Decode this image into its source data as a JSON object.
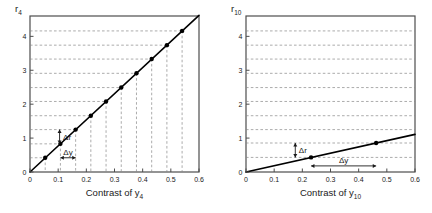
{
  "figure": {
    "background": "#ffffff",
    "panel_count": 2
  },
  "chart_data": [
    {
      "type": "line",
      "title": "",
      "panel_id": "left",
      "ylabel": "r_4",
      "ylabel_base": "r",
      "ylabel_sub": "4",
      "xlabel": "Contrast of y_4",
      "xlabel_base": "Contrast of y",
      "xlabel_sub": "4",
      "xlim": [
        0,
        0.6
      ],
      "ylim": [
        0,
        4.6
      ],
      "xticks": [
        0,
        0.1,
        0.2,
        0.3,
        0.4,
        0.5,
        0.6
      ],
      "xticklabels": [
        "0",
        "0.1",
        "0.2",
        "0.3",
        "0.4",
        "0.5",
        "0.6"
      ],
      "yticks": [
        0,
        1,
        2,
        3,
        4
      ],
      "yticklabels": [
        "0",
        "1",
        "2",
        "3",
        "4"
      ],
      "grid": "dashed-from-points",
      "line": {
        "slope": 7.7,
        "intercept": 0,
        "x_start": 0,
        "x_end": 0.6,
        "color": "#000000",
        "width": 1.6
      },
      "markers": {
        "shape": "dot",
        "color": "#000000",
        "size": 2.2
      },
      "x": [
        0.054,
        0.108,
        0.162,
        0.216,
        0.27,
        0.324,
        0.378,
        0.432,
        0.486,
        0.54
      ],
      "values": [
        0.42,
        0.83,
        1.25,
        1.66,
        2.08,
        2.49,
        2.91,
        3.33,
        3.74,
        4.16
      ],
      "gridlines_y": [
        0.42,
        0.83,
        1.25,
        1.66,
        2.08,
        2.49,
        2.91,
        3.33,
        3.74,
        4.16
      ],
      "gridlines_x": [
        0.054,
        0.108,
        0.162,
        0.216,
        0.27,
        0.324,
        0.378,
        0.432,
        0.486,
        0.54
      ],
      "annotations": [
        {
          "name": "delta-r",
          "label": "Δr",
          "type": "vertical-arrow",
          "x": 0.105,
          "y0": 0.83,
          "y1": 1.25
        },
        {
          "name": "delta-y",
          "label": "Δy",
          "type": "horizontal-arrow",
          "y": 0.42,
          "x0": 0.108,
          "x1": 0.162
        }
      ]
    },
    {
      "type": "line",
      "title": "",
      "panel_id": "right",
      "ylabel": "r_10",
      "ylabel_base": "r",
      "ylabel_sub": "10",
      "xlabel": "Contrast of y_10",
      "xlabel_base": "Contrast of y",
      "xlabel_sub": "10",
      "xlim": [
        0,
        0.6
      ],
      "ylim": [
        0,
        4.6
      ],
      "xticks": [
        0,
        0.1,
        0.2,
        0.3,
        0.4,
        0.5,
        0.6
      ],
      "xticklabels": [
        "0",
        "0.1",
        "0.2",
        "0.3",
        "0.4",
        "0.5",
        "0.6"
      ],
      "yticks": [
        0,
        1,
        2,
        3,
        4
      ],
      "yticklabels": [
        "0",
        "1",
        "2",
        "3",
        "4"
      ],
      "grid": "dashed-horizontal-full-width",
      "line": {
        "slope": 1.85,
        "intercept": 0,
        "x_start": 0,
        "x_end": 0.6,
        "color": "#000000",
        "width": 1.6
      },
      "markers": {
        "shape": "dot",
        "color": "#000000",
        "size": 2.2
      },
      "x": [
        0.231,
        0.462
      ],
      "values": [
        0.43,
        0.855
      ],
      "gridlines_y": [
        0.43,
        0.855,
        1.25,
        1.66,
        2.08,
        2.49,
        2.91,
        3.33,
        3.74,
        4.16
      ],
      "gridlines_x": [],
      "annotations": [
        {
          "name": "delta-r",
          "label": "Δr",
          "type": "vertical-arrow",
          "x": 0.175,
          "y0": 0.43,
          "y1": 0.855
        },
        {
          "name": "delta-y",
          "label": "Δy",
          "type": "horizontal-arrow",
          "y": 0.18,
          "x0": 0.231,
          "x1": 0.462
        }
      ]
    }
  ],
  "colors": {
    "line": "#000000",
    "grid": "#888888",
    "axis": "#4d4d4d",
    "text": "#1a1a1a",
    "background": "#ffffff"
  }
}
